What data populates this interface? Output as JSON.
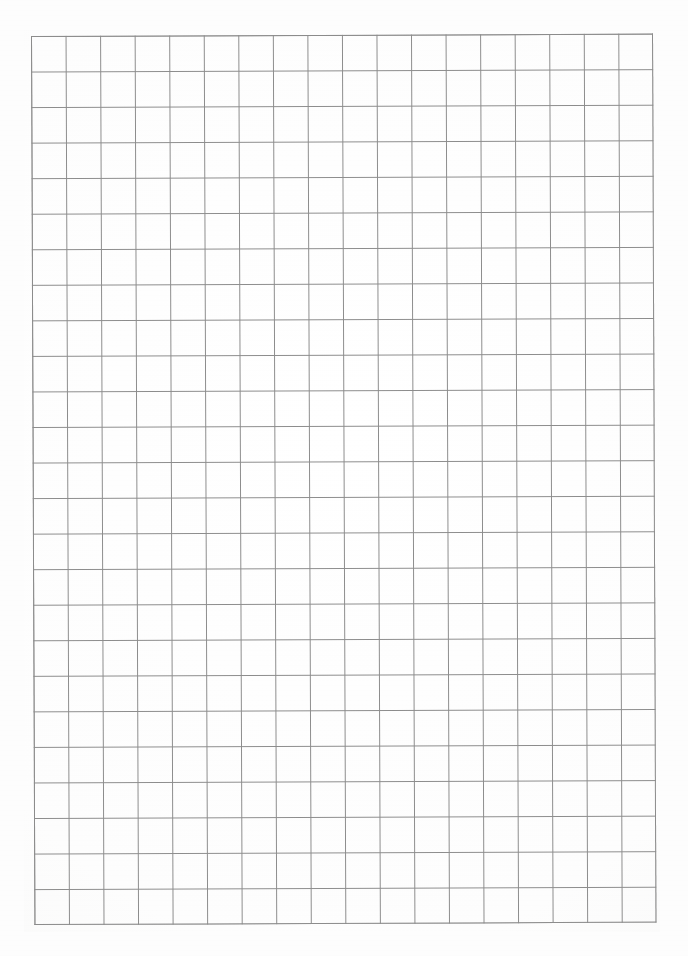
{
  "document": {
    "kind": "graph-paper-scan",
    "title": "Blank square-ruled graph paper",
    "page_width_px": 688,
    "page_height_px": 956,
    "page_background_color": "#fdfdfd",
    "content_text": "",
    "annotations": []
  },
  "grid": {
    "columns": 18,
    "rows": 25,
    "cell_width_px": 34.56,
    "cell_height_px": 35.56,
    "line_color": "#8c8c8c",
    "line_width_px": 1.1,
    "border_color": "#8c8c8c",
    "origin_x_px": 31,
    "origin_y_px": 36,
    "width_px": 622,
    "height_px": 889,
    "skew_degrees": -0.22,
    "cell_fill_color": "#ffffff"
  },
  "margins": {
    "top_px": 36,
    "left_px": 31,
    "right_px": 35,
    "bottom_px": 31
  }
}
